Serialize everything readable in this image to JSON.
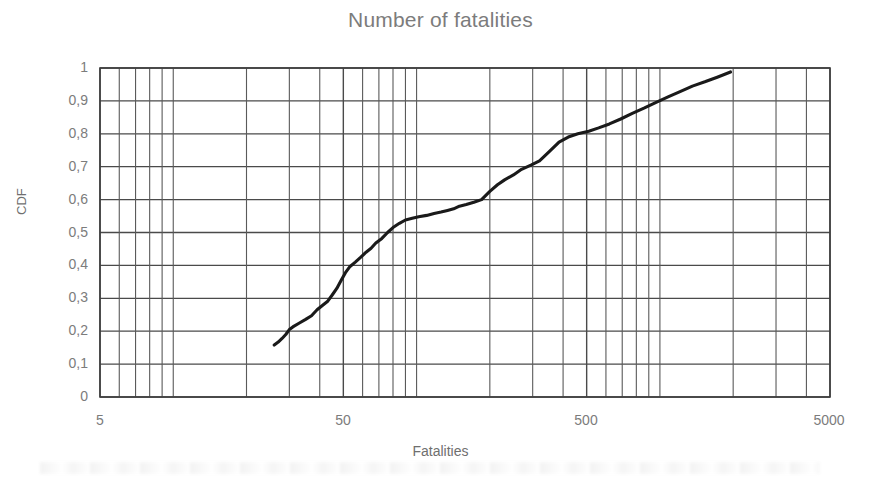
{
  "chart_data": {
    "type": "line",
    "title": "Number of fatalities",
    "xlabel": "Fatalities",
    "ylabel": "CDF",
    "xscale": "log",
    "yscale": "linear",
    "xlim": [
      5,
      5000
    ],
    "ylim": [
      0,
      1
    ],
    "grid": true,
    "legend": null,
    "x_tick_labels": [
      "5",
      "50",
      "500",
      "5000"
    ],
    "x_tick_values": [
      5,
      50,
      500,
      5000
    ],
    "y_tick_labels": [
      "0",
      "0,1",
      "0,2",
      "0,3",
      "0,4",
      "0,5",
      "0,6",
      "0,7",
      "0,8",
      "0,9",
      "1"
    ],
    "y_tick_values": [
      0,
      0.1,
      0.2,
      0.3,
      0.4,
      0.5,
      0.6,
      0.7,
      0.8,
      0.9,
      1
    ],
    "series": [
      {
        "name": "Empirical CDF of fatalities",
        "color": "#1a1a1a",
        "x": [
          26,
          27,
          28,
          29,
          30,
          31,
          33,
          35,
          37,
          39,
          41,
          43,
          45,
          47,
          49,
          51,
          53,
          56,
          59,
          62,
          65,
          68,
          72,
          76,
          80,
          85,
          90,
          96,
          102,
          110,
          118,
          126,
          134,
          142,
          150,
          160,
          172,
          185,
          200,
          215,
          230,
          250,
          270,
          295,
          320,
          350,
          385,
          420,
          460,
          510,
          560,
          620,
          690,
          770,
          860,
          960,
          1080,
          1210,
          1360,
          1530,
          1720,
          1950
        ],
        "y": [
          0.158,
          0.167,
          0.178,
          0.19,
          0.205,
          0.213,
          0.225,
          0.236,
          0.247,
          0.265,
          0.278,
          0.29,
          0.31,
          0.33,
          0.355,
          0.378,
          0.395,
          0.41,
          0.425,
          0.44,
          0.452,
          0.468,
          0.482,
          0.5,
          0.515,
          0.528,
          0.538,
          0.543,
          0.548,
          0.552,
          0.558,
          0.562,
          0.567,
          0.572,
          0.58,
          0.585,
          0.592,
          0.6,
          0.625,
          0.645,
          0.66,
          0.675,
          0.692,
          0.705,
          0.718,
          0.745,
          0.775,
          0.79,
          0.8,
          0.808,
          0.818,
          0.83,
          0.845,
          0.862,
          0.878,
          0.895,
          0.912,
          0.928,
          0.945,
          0.958,
          0.972,
          0.988
        ]
      }
    ]
  },
  "figure": {
    "title": "Number of fatalities",
    "x_axis_title": "Fatalities",
    "y_axis_title": "CDF",
    "x_labels": [
      "5",
      "50",
      "500",
      "5000"
    ],
    "y_labels": [
      "1",
      "0,9",
      "0,8",
      "0,7",
      "0,6",
      "0,5",
      "0,4",
      "0,3",
      "0,2",
      "0,1",
      "0"
    ],
    "colors": {
      "title": "#7c7c7c",
      "tick": "#7c7c7c",
      "grid": "#4a4a4a",
      "line": "#1a1a1a",
      "background": "#ffffff"
    }
  }
}
